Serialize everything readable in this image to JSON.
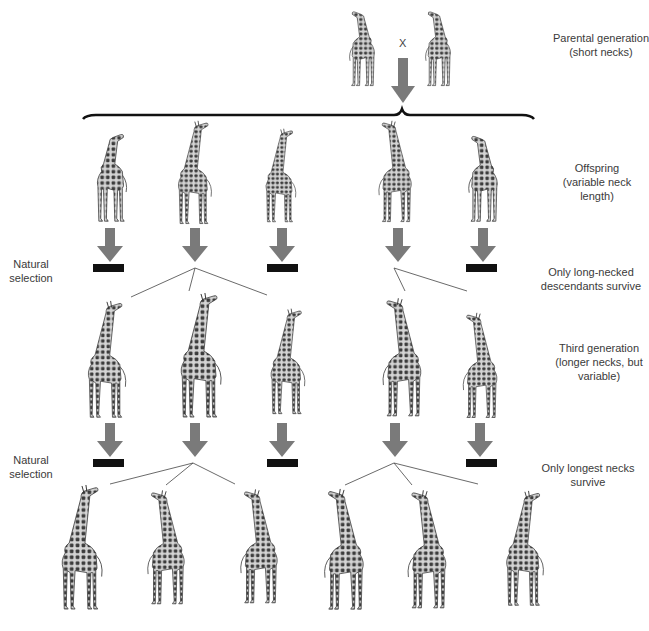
{
  "diagram": {
    "cross_symbol": "X",
    "colors": {
      "arrow": "#7a7a7a",
      "bar": "#111111",
      "brace": "#111111",
      "branch_line": "#444444",
      "giraffe_body": "#cfcfcf",
      "giraffe_spots": "#3a3a3a"
    },
    "labels": {
      "parental": [
        "Parental generation",
        "(short necks)"
      ],
      "offspring": [
        "Offspring",
        "(variable neck",
        "length)"
      ],
      "natural_selection_1": [
        "Natural",
        "selection"
      ],
      "survive_1": [
        "Only long-necked",
        "descendants survive"
      ],
      "third_generation": [
        "Third generation",
        "(longer necks, but",
        "variable)"
      ],
      "natural_selection_2": [
        "Natural",
        "selection"
      ],
      "survive_2": [
        "Only longest necks",
        "survive"
      ]
    },
    "generations": [
      {
        "name": "parental",
        "giraffes": [
          {
            "icon": "giraffe-icon",
            "neck": "short"
          },
          {
            "icon": "giraffe-icon",
            "neck": "short"
          }
        ]
      },
      {
        "name": "offspring",
        "giraffes": [
          {
            "neck": "short",
            "survives": false
          },
          {
            "neck": "long",
            "survives": true
          },
          {
            "neck": "short",
            "survives": false
          },
          {
            "neck": "long",
            "survives": true
          },
          {
            "neck": "short",
            "survives": false
          }
        ]
      },
      {
        "name": "third_generation",
        "giraffes": [
          {
            "neck": "medium",
            "survives": false
          },
          {
            "neck": "longest",
            "survives": true
          },
          {
            "neck": "medium",
            "survives": false
          },
          {
            "neck": "longest",
            "survives": true
          },
          {
            "neck": "medium",
            "survives": false
          }
        ]
      },
      {
        "name": "fourth_generation",
        "giraffes": [
          {
            "neck": "longest"
          },
          {
            "neck": "longest"
          },
          {
            "neck": "longest"
          },
          {
            "neck": "longest"
          },
          {
            "neck": "longest"
          },
          {
            "neck": "longest"
          }
        ]
      }
    ]
  }
}
